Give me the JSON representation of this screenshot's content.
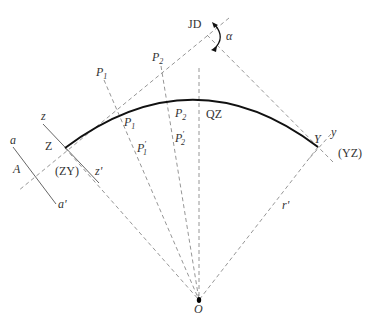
{
  "figure": {
    "points": {
      "JD": "JD",
      "alpha": "α",
      "P1_top": "P",
      "P1_top_sub": "1",
      "P2_top": "P",
      "P2_top_sub": "2",
      "P1_curve": "P",
      "P1_curve_sub": "1",
      "P2_curve": "P",
      "P2_curve_sub": "2",
      "P1_prime": "P",
      "P1_prime_sub": "1",
      "P2_prime": "P",
      "P2_prime_sub": "2",
      "QZ": "QZ",
      "Z": "Z",
      "ZY": "(ZY)",
      "Y": "Y",
      "YZ": "(YZ)",
      "z": "z",
      "z_prime": "z'",
      "y": "y",
      "a": "a",
      "a_prime": "a'",
      "A": "A",
      "r_prime": "r'",
      "O": "O"
    },
    "colors": {
      "curve": "#111111",
      "dashed": "#8a8a8a",
      "text": "#333333"
    }
  }
}
